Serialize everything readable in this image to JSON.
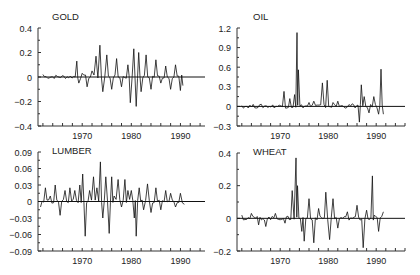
{
  "figure": {
    "background": "#ffffff",
    "line_color": "#111111"
  },
  "chart_data": [
    {
      "type": "line",
      "title": "GOLD",
      "xlabel": "",
      "ylabel": "",
      "xlim": [
        1961,
        1995
      ],
      "ylim": [
        -0.4,
        0.4
      ],
      "xticks": [
        1970,
        1980,
        1990
      ],
      "xtick_labels": [
        "1970",
        "1980",
        "1990"
      ],
      "yticks": [
        -0.4,
        -0.2,
        0,
        0.2,
        0.4
      ],
      "ytick_labels": [
        "-0.4",
        "-0.2",
        "0",
        "0.2",
        "0.4"
      ],
      "zero_line": true,
      "series": [
        {
          "name": "GOLD",
          "x": [
            1962,
            1968.9,
            1969.3,
            1970,
            1971,
            1972,
            1972.8,
            1973.6,
            1974.2,
            1975,
            1976,
            1977,
            1978,
            1979.3,
            1979.8,
            1980.5,
            1981,
            1981.5,
            1982,
            1983,
            1984,
            1985,
            1986,
            1987,
            1988,
            1989,
            1990,
            1990.5
          ],
          "values": [
            0.02,
            0.13,
            -0.05,
            0.03,
            -0.08,
            0.05,
            0.17,
            0.26,
            -0.12,
            0.18,
            -0.1,
            0.15,
            -0.08,
            0.1,
            -0.21,
            0.23,
            -0.24,
            0.2,
            -0.12,
            0.18,
            -0.1,
            0.14,
            -0.05,
            0.09,
            -0.1,
            0.1,
            -0.11,
            -0.07
          ]
        }
      ]
    },
    {
      "type": "line",
      "title": "OIL",
      "xlabel": "",
      "ylabel": "",
      "xlim": [
        1961,
        1996
      ],
      "ylim": [
        -0.3,
        1.2
      ],
      "xticks": [
        1970,
        1980,
        1990
      ],
      "xtick_labels": [
        "1970",
        "1980",
        "1990"
      ],
      "yticks": [
        -0.3,
        0,
        0.3,
        0.6,
        0.9,
        1.2
      ],
      "ytick_labels": [
        "-0.3",
        "0",
        "0.3",
        "0.6",
        "0.9",
        "1.2"
      ],
      "zero_line": true,
      "series": [
        {
          "name": "OIL",
          "x": [
            1962,
            1970.8,
            1972,
            1973,
            1973.5,
            1973.8,
            1976,
            1977,
            1978.8,
            1979.8,
            1981,
            1982,
            1985,
            1986.5,
            1986.9,
            1987.5,
            1988.5,
            1989.5,
            1990.5,
            1991,
            1991.5
          ],
          "values": [
            0.01,
            0.23,
            0.12,
            0.18,
            1.13,
            0.56,
            0.06,
            0.08,
            0.36,
            0.4,
            0.06,
            0.08,
            0.04,
            -0.24,
            0.33,
            0.15,
            -0.1,
            0.15,
            -0.12,
            0.57,
            -0.12
          ]
        }
      ]
    },
    {
      "type": "line",
      "title": "LUMBER",
      "xlabel": "",
      "ylabel": "",
      "xlim": [
        1961,
        1995
      ],
      "ylim": [
        -0.09,
        0.09
      ],
      "xticks": [
        1970,
        1980,
        1990
      ],
      "xtick_labels": [
        "1970",
        "1980",
        "1990"
      ],
      "yticks": [
        -0.09,
        -0.06,
        -0.03,
        0,
        0.03,
        0.06,
        0.09
      ],
      "ytick_labels": [
        "-0.09",
        "-0.06",
        "-0.03",
        "0",
        "0.03",
        "0.06",
        "0.09"
      ],
      "zero_line": true,
      "series": [
        {
          "name": "LUMBER",
          "x": [
            1961.5,
            1962.5,
            1963.5,
            1964.5,
            1965.5,
            1966.5,
            1967.5,
            1968.5,
            1969.5,
            1970.1,
            1970.6,
            1971.5,
            1972.3,
            1973,
            1973.7,
            1974.2,
            1974.8,
            1975.5,
            1976,
            1976.5,
            1977.3,
            1978,
            1978.7,
            1979.3,
            1980,
            1980.6,
            1981,
            1981.6,
            1982.5,
            1983.3,
            1984,
            1985,
            1986,
            1987,
            1988,
            1989,
            1990,
            1990.8
          ],
          "values": [
            -0.01,
            0.025,
            0.01,
            0.03,
            -0.025,
            0.02,
            0.025,
            0.02,
            0.03,
            0.05,
            -0.063,
            0.02,
            0.045,
            0.025,
            0.072,
            -0.03,
            0.045,
            -0.058,
            0.045,
            0.01,
            0.04,
            -0.01,
            0.04,
            0.02,
            0.02,
            -0.03,
            -0.063,
            0.025,
            -0.015,
            0.032,
            -0.02,
            0.025,
            -0.015,
            0.02,
            0.015,
            -0.01,
            0.015,
            -0.005
          ]
        }
      ]
    },
    {
      "type": "line",
      "title": "WHEAT",
      "xlabel": "",
      "ylabel": "",
      "xlim": [
        1961,
        1996
      ],
      "ylim": [
        -0.2,
        0.4
      ],
      "xticks": [
        1970,
        1980,
        1990
      ],
      "xtick_labels": [
        "1970",
        "1980",
        "1990"
      ],
      "yticks": [
        -0.2,
        0,
        0.2,
        0.4
      ],
      "ytick_labels": [
        "-0.2",
        "0",
        "0.2",
        "0.4"
      ],
      "zero_line": true,
      "series": [
        {
          "name": "WHEAT",
          "x": [
            1962,
            1964,
            1965.5,
            1967,
            1969,
            1971,
            1972.5,
            1973.3,
            1973.6,
            1974.5,
            1975,
            1976,
            1977,
            1978,
            1979.5,
            1980.3,
            1981,
            1982,
            1984,
            1986,
            1987.3,
            1988,
            1989.2,
            1989.6,
            1990.5,
            1991.5
          ],
          "values": [
            0.02,
            0.03,
            -0.04,
            -0.05,
            0.03,
            -0.03,
            0.17,
            0.37,
            0.2,
            -0.08,
            -0.14,
            0.12,
            -0.15,
            0.06,
            0.16,
            -0.13,
            0.12,
            -0.06,
            0.04,
            0.08,
            -0.18,
            0.05,
            0.26,
            0.02,
            -0.08,
            0.04
          ]
        }
      ]
    }
  ]
}
